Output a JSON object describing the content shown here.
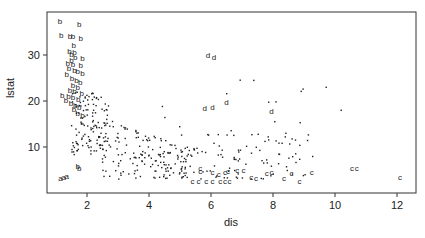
{
  "chart_data": {
    "type": "scatter",
    "title": "",
    "xlabel": "dis",
    "ylabel": "lstat",
    "xlim": [
      0.7,
      12.6
    ],
    "ylim": [
      0,
      35.4
    ],
    "xticks": [
      2,
      4,
      6,
      8,
      10,
      12
    ],
    "yticks": [
      10,
      20,
      30
    ],
    "grid": false,
    "legend": null,
    "colors": {
      "points": "#222222",
      "axes": "#333333"
    },
    "labeled_series": [
      {
        "name": "b",
        "points": [
          [
            1.13,
            37.5
          ],
          [
            1.75,
            36.8
          ],
          [
            1.17,
            34.4
          ],
          [
            1.45,
            34.2
          ],
          [
            1.55,
            34.1
          ],
          [
            1.8,
            33.7
          ],
          [
            1.57,
            32.2
          ],
          [
            1.44,
            30.8
          ],
          [
            1.6,
            30.7
          ],
          [
            1.5,
            30.2
          ],
          [
            1.62,
            29.5
          ],
          [
            1.85,
            29.3
          ],
          [
            1.5,
            29.0
          ],
          [
            1.38,
            28.3
          ],
          [
            1.55,
            28.0
          ],
          [
            1.8,
            27.8
          ],
          [
            1.42,
            27.1
          ],
          [
            1.6,
            26.8
          ],
          [
            1.7,
            26.5
          ],
          [
            1.85,
            26.0
          ],
          [
            1.35,
            25.8
          ],
          [
            1.52,
            25.0
          ],
          [
            1.66,
            24.6
          ],
          [
            1.78,
            24.2
          ],
          [
            1.55,
            23.5
          ],
          [
            1.7,
            23.0
          ],
          [
            1.45,
            22.5
          ],
          [
            1.6,
            22.1
          ],
          [
            1.83,
            21.8
          ],
          [
            1.2,
            21.3
          ],
          [
            1.4,
            21.2
          ],
          [
            1.55,
            20.8
          ],
          [
            1.72,
            20.5
          ],
          [
            1.32,
            20.2
          ],
          [
            1.48,
            19.5
          ],
          [
            1.62,
            19.2
          ],
          [
            1.75,
            18.8
          ],
          [
            1.58,
            18.2
          ],
          [
            1.7,
            17.5
          ],
          [
            1.85,
            17.0
          ]
        ]
      },
      {
        "name": "a",
        "points": [
          [
            1.15,
            3.3
          ],
          [
            1.25,
            3.5
          ],
          [
            1.35,
            3.7
          ]
        ]
      },
      {
        "name": "B",
        "points": [
          [
            1.7,
            5.9
          ],
          [
            1.75,
            5.5
          ]
        ]
      },
      {
        "name": "d",
        "points": [
          [
            5.9,
            30.1
          ],
          [
            6.1,
            29.6
          ],
          [
            5.8,
            18.4
          ],
          [
            6.05,
            18.6
          ],
          [
            6.5,
            19.8
          ],
          [
            7.95,
            17.9
          ]
        ]
      },
      {
        "name": "c",
        "points": [
          [
            5.4,
            2.6
          ],
          [
            5.6,
            2.7
          ],
          [
            5.85,
            2.6
          ],
          [
            6.05,
            2.6
          ],
          [
            6.3,
            2.6
          ],
          [
            6.45,
            2.7
          ],
          [
            6.6,
            2.7
          ],
          [
            5.65,
            4.9
          ],
          [
            5.65,
            5.4
          ],
          [
            6.05,
            4.6
          ],
          [
            6.25,
            4.2
          ],
          [
            6.45,
            4.6
          ],
          [
            6.55,
            4.9
          ],
          [
            6.85,
            5.0
          ],
          [
            7.05,
            5.1
          ],
          [
            7.3,
            3.4
          ],
          [
            7.45,
            3.3
          ],
          [
            7.8,
            4.3
          ],
          [
            7.95,
            4.6
          ],
          [
            8.35,
            3.2
          ],
          [
            8.6,
            4.3
          ],
          [
            8.85,
            2.6
          ],
          [
            9.25,
            4.5
          ],
          [
            10.55,
            5.5
          ],
          [
            10.7,
            5.4
          ],
          [
            12.1,
            3.5
          ]
        ]
      }
    ],
    "unlabeled_series": {
      "name": "points",
      "marker": "dot",
      "approx_count": 400,
      "description": "Dense cloud decreasing from lstat ~20-25 near dis 1.5-2.5 to lstat ~2-10 at dis 4-9, sparse beyond dis 9"
    }
  }
}
